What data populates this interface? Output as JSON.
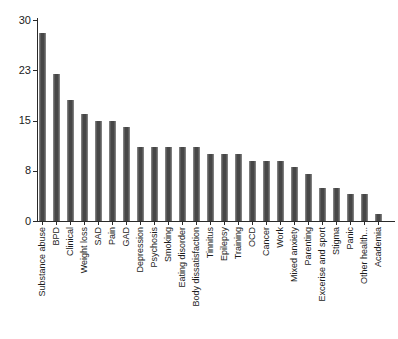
{
  "chart_data": {
    "type": "bar",
    "categories": [
      "Substance abuse",
      "BPD",
      "Clinical",
      "Weight loss",
      "SAD",
      "Pain",
      "GAD",
      "Depression",
      "Psychosis",
      "Smoking",
      "Eating disorder",
      "Body dissatisfaction",
      "Tinnitus",
      "Epilepsy",
      "Training",
      "OCD",
      "Cancer",
      "Work",
      "Mixed anxiety",
      "Parenting",
      "Excerise and sport",
      "Stigma",
      "Panic",
      "Other health...",
      "Academia"
    ],
    "values": [
      28,
      22,
      18,
      16,
      15,
      15,
      14,
      11,
      11,
      11,
      11,
      11,
      10,
      10,
      10,
      9,
      9,
      9,
      8,
      7,
      5,
      5,
      4,
      4,
      1
    ],
    "title": "",
    "xlabel": "",
    "ylabel": "",
    "ylim": [
      0,
      30
    ],
    "y_ticks": [
      {
        "value": 0,
        "label": "0"
      },
      {
        "value": 7.5,
        "label": "8"
      },
      {
        "value": 15,
        "label": "15"
      },
      {
        "value": 22.5,
        "label": "23"
      },
      {
        "value": 30,
        "label": "30"
      }
    ],
    "grid": false,
    "legend": null,
    "bar_color": "#474747",
    "axis_color": "#2a2a2a",
    "background": "#ffffff"
  }
}
